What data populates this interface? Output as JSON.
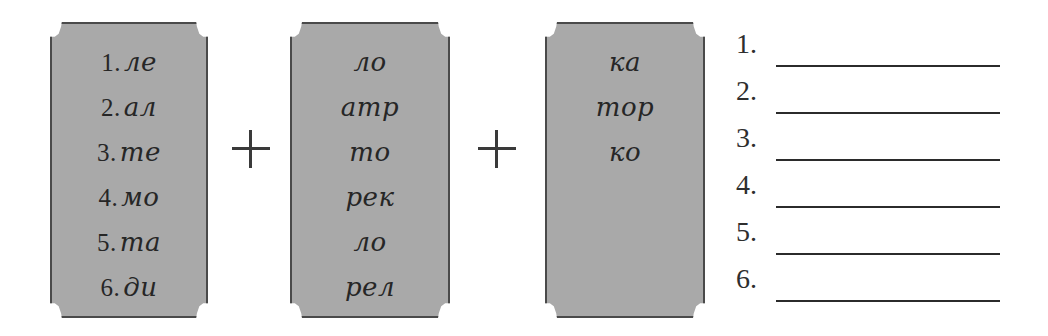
{
  "worksheet": {
    "title": "Syllable combining exercise",
    "background_color": "#ffffff",
    "ink_color": "#2b2b2b",
    "plaque_fill_color": "#a9a9a9",
    "plaque_border_color": "#4a4a4a"
  },
  "columns": [
    {
      "name": "first-syllable-column",
      "numbered": true,
      "items": [
        {
          "number": "1.",
          "syllable": "ле"
        },
        {
          "number": "2.",
          "syllable": "ал"
        },
        {
          "number": "3.",
          "syllable": "те"
        },
        {
          "number": "4.",
          "syllable": "мо"
        },
        {
          "number": "5.",
          "syllable": "та"
        },
        {
          "number": "6.",
          "syllable": "ди"
        }
      ]
    },
    {
      "name": "second-syllable-column",
      "numbered": false,
      "items": [
        {
          "number": "",
          "syllable": "ло"
        },
        {
          "number": "",
          "syllable": "атр"
        },
        {
          "number": "",
          "syllable": "то"
        },
        {
          "number": "",
          "syllable": "рек"
        },
        {
          "number": "",
          "syllable": "ло"
        },
        {
          "number": "",
          "syllable": "рел"
        }
      ]
    },
    {
      "name": "third-syllable-column",
      "numbered": false,
      "items": [
        {
          "number": "",
          "syllable": "ка"
        },
        {
          "number": "",
          "syllable": "тор"
        },
        {
          "number": "",
          "syllable": "ко"
        }
      ]
    }
  ],
  "operators": [
    {
      "symbol": "+"
    },
    {
      "symbol": "+"
    }
  ],
  "answers": {
    "name": "answer-lines",
    "rows": [
      {
        "number": "1.",
        "value": ""
      },
      {
        "number": "2.",
        "value": ""
      },
      {
        "number": "3.",
        "value": ""
      },
      {
        "number": "4.",
        "value": ""
      },
      {
        "number": "5.",
        "value": ""
      },
      {
        "number": "6.",
        "value": ""
      }
    ]
  }
}
